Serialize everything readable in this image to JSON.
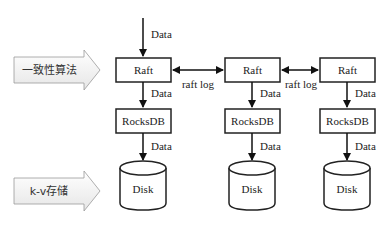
{
  "diagram": {
    "layers": [
      {
        "id": "consensus",
        "label": "一致性算法"
      },
      {
        "id": "storage",
        "label": "k-v存储"
      }
    ],
    "input_label": "Data",
    "nodes": [
      {
        "raft": "Raft",
        "rocksdb": "RocksDB",
        "disk": "Disk",
        "raft_to_rocks": "Data",
        "rocks_to_disk": "Data"
      },
      {
        "raft": "Raft",
        "rocksdb": "RocksDB",
        "disk": "Disk",
        "raft_to_rocks": "Data",
        "rocks_to_disk": "Data"
      },
      {
        "raft": "Raft",
        "rocksdb": "RocksDB",
        "disk": "Disk",
        "raft_to_rocks": "Data",
        "rocks_to_disk": "Data"
      }
    ],
    "links": [
      {
        "from": 0,
        "to": 1,
        "label": "raft log"
      },
      {
        "from": 1,
        "to": 2,
        "label": "raft log"
      }
    ]
  }
}
